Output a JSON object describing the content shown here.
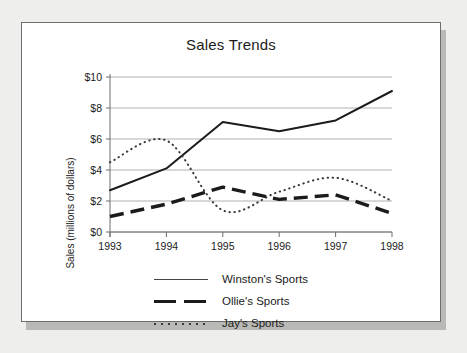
{
  "card": {
    "title": "Sales Trends"
  },
  "chart_data": {
    "type": "line",
    "title": "Sales Trends",
    "xlabel": "",
    "ylabel": "Sales (millions of dollars)",
    "x": [
      1993,
      1994,
      1995,
      1996,
      1997,
      1998
    ],
    "xtick_labels": [
      "1993",
      "1994",
      "1995",
      "1996",
      "1997",
      "1998"
    ],
    "ytick_labels": [
      "$0",
      "$2",
      "$4",
      "$6",
      "$8",
      "$10"
    ],
    "ytick_values": [
      0,
      2,
      4,
      6,
      8,
      10
    ],
    "xlim": [
      1993,
      1998
    ],
    "ylim": [
      0,
      10
    ],
    "grid": "horizontal",
    "legend_position": "below",
    "series": [
      {
        "name": "Winston's Sports",
        "style": "solid-thin",
        "color": "#1b1b1b",
        "values": [
          2.7,
          4.1,
          7.1,
          6.5,
          7.2,
          9.1
        ]
      },
      {
        "name": "Ollie's Sports",
        "style": "dashed-thick",
        "color": "#1b1b1b",
        "values": [
          1.0,
          1.8,
          2.9,
          2.1,
          2.4,
          1.2
        ]
      },
      {
        "name": "Jay's Sports",
        "style": "dotted",
        "color": "#3a3a3a",
        "values": [
          4.5,
          5.9,
          1.4,
          2.6,
          3.5,
          2.0
        ]
      }
    ]
  },
  "legend": {
    "items": [
      {
        "label": "Winston's Sports",
        "key": "solid-line-key"
      },
      {
        "label": "Ollie's Sports",
        "key": "dashed-line-key"
      },
      {
        "label": "Jay's Sports",
        "key": "dotted-line-key"
      }
    ]
  }
}
